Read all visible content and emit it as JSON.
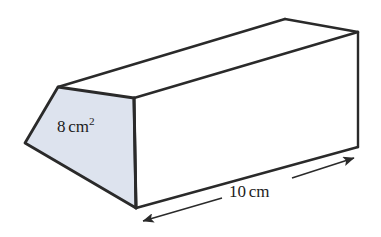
{
  "figure": {
    "kind": "triangular-prism-3d-diagram",
    "background_color": "#ffffff",
    "stroke_color": "#2a2a2a",
    "cross_section_fill": "#dde3ee"
  },
  "labels": {
    "area": {
      "value": "8",
      "unit": "cm",
      "exponent": "2",
      "full_text": "8 cm2",
      "meaning": "cross-sectional area"
    },
    "length": {
      "value": "10",
      "unit": "cm",
      "full_text": "10 cm",
      "meaning": "prism length"
    }
  },
  "geometry": {
    "cross_section_face": {
      "points": "58,87 134,98 136,208 25,143",
      "fill": "#dde3ee"
    },
    "top_face": {
      "points": "58,87 285,19 358,32 134,98",
      "fill": "#ffffff"
    },
    "side_face": {
      "points": "134,98 358,32 358,147 136,208",
      "fill": "#ffffff"
    },
    "edges": [
      {
        "name": "front-apex-to-front-right",
        "d": "M 58 87 L 134 98"
      },
      {
        "name": "front-right-to-front-bottom",
        "d": "M 134 98 L 136 208"
      },
      {
        "name": "front-bottom-to-front-left",
        "d": "M 136 208 L 25 143"
      },
      {
        "name": "front-left-to-front-apex",
        "d": "M 25 143 L 58 87"
      },
      {
        "name": "top-ridge-front-to-back",
        "d": "M 58 87 L 285 19"
      },
      {
        "name": "back-ridge",
        "d": "M 285 19 L 358 32"
      },
      {
        "name": "top-right-edge",
        "d": "M 134 98 L 358 32"
      },
      {
        "name": "back-vertical-edge",
        "d": "M 358 32 L 358 147"
      },
      {
        "name": "bottom-right-edge",
        "d": "M 136 208 L 358 147"
      }
    ],
    "dimension_arrow": {
      "name": "length-dimension-arrow",
      "from": "140,222",
      "to": "357,157",
      "double_headed": true
    }
  }
}
